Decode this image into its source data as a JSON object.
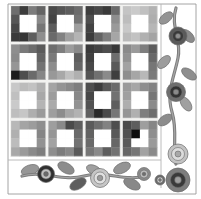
{
  "artwork": {
    "title": "Patchwork Quilt Panel with Floral Vine Border",
    "type": "textile-pattern",
    "palette": {
      "background": "#ffffff",
      "sashing": "#f2f2f0",
      "frame_line": "#9a9a9a",
      "vine_stem": "#7d7d7d",
      "leaf_light": "#a8a8a8",
      "leaf_mid": "#8c8c8c",
      "leaf_dark": "#5e5e5e",
      "flower_outer_dark": "#4a4a4a",
      "flower_outer_mid": "#8f8f8f",
      "flower_outer_light": "#cfcfcf",
      "flower_core_dark": "#2e2e2e",
      "flower_core_light": "#bdbdbd"
    },
    "canvas": {
      "width": 201,
      "height": 199
    }
  },
  "quilt": {
    "label": "quilt-grid",
    "block_rows": 4,
    "block_cols": 4,
    "cells_per_block": 4,
    "grid_origin": {
      "x": 11,
      "y": 6
    },
    "grid_size": {
      "width": 146,
      "height": 150
    },
    "sashing_width": 3,
    "blocks": [
      {
        "name": "block-r1c1",
        "cells": [
          [
            "#6e6e6e",
            "#3c3c3c",
            "#7c7c7c",
            "#646464"
          ],
          [
            "#565656",
            "#ffffff",
            "#ffffff",
            "#8a8a8a"
          ],
          [
            "#484848",
            "#ffffff",
            "#ffffff",
            "#767676"
          ],
          [
            "#3a3a3a",
            "#353535",
            "#5e5e5e",
            "#8e8e8e"
          ]
        ]
      },
      {
        "name": "block-r1c2",
        "cells": [
          [
            "#4a4a4a",
            "#555555",
            "#5e5e5e",
            "#6c6c6c"
          ],
          [
            "#444444",
            "#ffffff",
            "#ffffff",
            "#747474"
          ],
          [
            "#5c5c5c",
            "#ffffff",
            "#ffffff",
            "#9e9e9e"
          ],
          [
            "#6a6a6a",
            "#828282",
            "#a0a0a0",
            "#b4b4b4"
          ]
        ]
      },
      {
        "name": "block-r1c3",
        "cells": [
          [
            "#3e3e3e",
            "#484848",
            "#3a3a3a",
            "#6a6a6a"
          ],
          [
            "#4e4e4e",
            "#ffffff",
            "#ffffff",
            "#8e8e8e"
          ],
          [
            "#424242",
            "#ffffff",
            "#ffffff",
            "#9a9a9a"
          ],
          [
            "#3c3c3c",
            "#636363",
            "#7e7e7e",
            "#a6a6a6"
          ]
        ]
      },
      {
        "name": "block-r1c4",
        "cells": [
          [
            "#c4c4c4",
            "#cacaca",
            "#c0c0c0",
            "#b2b2b2"
          ],
          [
            "#bdbdbd",
            "#ffffff",
            "#ffffff",
            "#aeaeae"
          ],
          [
            "#c8c8c8",
            "#ffffff",
            "#ffffff",
            "#b6b6b6"
          ],
          [
            "#bababa",
            "#c2c2c2",
            "#b0b0b0",
            "#a4a4a4"
          ]
        ]
      },
      {
        "name": "block-r2c1",
        "cells": [
          [
            "#8e8e8e",
            "#7a7a7a",
            "#6c6c6c",
            "#5a5a5a"
          ],
          [
            "#8a8a8a",
            "#ffffff",
            "#ffffff",
            "#646464"
          ],
          [
            "#969696",
            "#ffffff",
            "#ffffff",
            "#727272"
          ],
          [
            "#1c1c1c",
            "#4e4e4e",
            "#6a6a6a",
            "#868686"
          ]
        ]
      },
      {
        "name": "block-r2c2",
        "cells": [
          [
            "#6e6e6e",
            "#7e7e7e",
            "#9c9c9c",
            "#8a8a8a"
          ],
          [
            "#7a7a7a",
            "#ffffff",
            "#ffffff",
            "#5e5e5e"
          ],
          [
            "#8c8c8c",
            "#ffffff",
            "#ffffff",
            "#666666"
          ],
          [
            "#989898",
            "#a8a8a8",
            "#c0c0c0",
            "#b0b0b0"
          ]
        ]
      },
      {
        "name": "block-r2c3",
        "cells": [
          [
            "#3a3a3a",
            "#444444",
            "#4e4e4e",
            "#383838"
          ],
          [
            "#404040",
            "#ffffff",
            "#ffffff",
            "#6e6e6e"
          ],
          [
            "#484848",
            "#ffffff",
            "#ffffff",
            "#5a5a5a"
          ],
          [
            "#555555",
            "#707070",
            "#8a8a8a",
            "#3e3e3e"
          ]
        ]
      },
      {
        "name": "block-r2c4",
        "cells": [
          [
            "#8a8a8a",
            "#9a9a9a",
            "#7e7e7e",
            "#5c5c5c"
          ],
          [
            "#929292",
            "#ffffff",
            "#ffffff",
            "#686868"
          ],
          [
            "#a2a2a2",
            "#ffffff",
            "#ffffff",
            "#767676"
          ],
          [
            "#8e8e8e",
            "#a6a6a6",
            "#b8b8b8",
            "#7a7a7a"
          ]
        ]
      },
      {
        "name": "block-r3c1",
        "cells": [
          [
            "#c8c8c8",
            "#bcbcbc",
            "#c2c2c2",
            "#b0b0b0"
          ],
          [
            "#c0c0c0",
            "#ffffff",
            "#ffffff",
            "#a8a8a8"
          ],
          [
            "#cacaca",
            "#ffffff",
            "#ffffff",
            "#b4b4b4"
          ],
          [
            "#bebebe",
            "#c6c6c6",
            "#aeaeae",
            "#9a9a9a"
          ]
        ]
      },
      {
        "name": "block-r3c2",
        "cells": [
          [
            "#a4a4a4",
            "#949494",
            "#8a8a8a",
            "#7e7e7e"
          ],
          [
            "#9c9c9c",
            "#ffffff",
            "#ffffff",
            "#888888"
          ],
          [
            "#aaaaaa",
            "#ffffff",
            "#ffffff",
            "#929292"
          ],
          [
            "#9e9e9e",
            "#8c8c8c",
            "#a6a6a6",
            "#b2b2b2"
          ]
        ]
      },
      {
        "name": "block-r3c3",
        "cells": [
          [
            "#4e4e4e",
            "#3c3c3c",
            "#585858",
            "#6a6a6a"
          ],
          [
            "#464646",
            "#ffffff",
            "#ffffff",
            "#727272"
          ],
          [
            "#525252",
            "#ffffff",
            "#ffffff",
            "#5e5e5e"
          ],
          [
            "#606060",
            "#2a2a2a",
            "#4a4a4a",
            "#767676"
          ]
        ]
      },
      {
        "name": "block-r3c4",
        "cells": [
          [
            "#9a9a9a",
            "#a6a6a6",
            "#8e8e8e",
            "#828282"
          ],
          [
            "#a0a0a0",
            "#ffffff",
            "#ffffff",
            "#767676"
          ],
          [
            "#aeaeae",
            "#ffffff",
            "#ffffff",
            "#8a8a8a"
          ],
          [
            "#969696",
            "#b0b0b0",
            "#7e7e7e",
            "#6e6e6e"
          ]
        ]
      },
      {
        "name": "block-r4c1",
        "cells": [
          [
            "#b8b8b8",
            "#a4a4a4",
            "#9c9c9c",
            "#8e8e8e"
          ],
          [
            "#b0b0b0",
            "#ffffff",
            "#ffffff",
            "#868686"
          ],
          [
            "#bcbcbc",
            "#ffffff",
            "#ffffff",
            "#929292"
          ],
          [
            "#a8a8a8",
            "#9a9a9a",
            "#8a8a8a",
            "#7e7e7e"
          ]
        ]
      },
      {
        "name": "block-r4c2",
        "cells": [
          [
            "#9e9e9e",
            "#8a8a8a",
            "#4a4a4a",
            "#5e5e5e"
          ],
          [
            "#969696",
            "#ffffff",
            "#ffffff",
            "#6a6a6a"
          ],
          [
            "#a2a2a2",
            "#ffffff",
            "#ffffff",
            "#727272"
          ],
          [
            "#8e8e8e",
            "#7c7c7c",
            "#888888",
            "#5a5a5a"
          ]
        ]
      },
      {
        "name": "block-r4c3",
        "cells": [
          [
            "#5a5a5a",
            "#6e6e6e",
            "#828282",
            "#4e4e4e"
          ],
          [
            "#626262",
            "#ffffff",
            "#ffffff",
            "#585858"
          ],
          [
            "#6a6a6a",
            "#ffffff",
            "#ffffff",
            "#666666"
          ],
          [
            "#767676",
            "#8a8a8a",
            "#5e5e5e",
            "#727272"
          ]
        ]
      },
      {
        "name": "block-r4c4",
        "cells": [
          [
            "#4a4a4a",
            "#5e5e5e",
            "#9e9e9e",
            "#868686"
          ],
          [
            "#525252",
            "#0e0e0e",
            "#ffffff",
            "#8e8e8e"
          ],
          [
            "#5a5a5a",
            "#ffffff",
            "#ffffff",
            "#9a9a9a"
          ],
          [
            "#666666",
            "#767676",
            "#a2a2a2",
            "#8a8a8a"
          ]
        ]
      }
    ]
  },
  "border_right": {
    "label": "right-vine-border",
    "stem_path": "M 176 8 C 170 26 182 40 178 58 C 174 78 166 92 172 112 C 178 132 172 148 176 164",
    "leaves": [
      {
        "name": "leaf-r1",
        "cx": 166,
        "cy": 18,
        "rx": 8,
        "ry": 4.5,
        "rot": -40,
        "fill": "#949494"
      },
      {
        "name": "leaf-r2",
        "cx": 188,
        "cy": 36,
        "rx": 8,
        "ry": 4.5,
        "rot": 45,
        "fill": "#8a8a8a"
      },
      {
        "name": "leaf-r3",
        "cx": 164,
        "cy": 62,
        "rx": 8,
        "ry": 4.5,
        "rot": -45,
        "fill": "#9c9c9c"
      },
      {
        "name": "leaf-r4",
        "cx": 189,
        "cy": 74,
        "rx": 8.5,
        "ry": 4.5,
        "rot": 35,
        "fill": "#8e8e8e"
      },
      {
        "name": "leaf-r5",
        "cx": 186,
        "cy": 104,
        "rx": 8,
        "ry": 4.5,
        "rot": 55,
        "fill": "#a0a0a0"
      },
      {
        "name": "leaf-r6",
        "cx": 165,
        "cy": 120,
        "rx": 8,
        "ry": 4.5,
        "rot": -35,
        "fill": "#8c8c8c"
      }
    ],
    "flowers": [
      {
        "name": "flower-r1",
        "cx": 178,
        "cy": 36,
        "r_outer": 9,
        "r_mid": 5.5,
        "r_core": 2.6,
        "outer": "#5a5a5a",
        "mid": "#3a3a3a",
        "core": "#8e8e8e"
      },
      {
        "name": "flower-r2",
        "cx": 176,
        "cy": 92,
        "r_outer": 9.5,
        "r_mid": 6,
        "r_core": 2.8,
        "outer": "#6e6e6e",
        "mid": "#333333",
        "core": "#8a8a8a"
      },
      {
        "name": "flower-r3",
        "cx": 178,
        "cy": 154,
        "r_outer": 10,
        "r_mid": 6.5,
        "r_core": 3,
        "outer": "#c2c2c2",
        "mid": "#dcdcdc",
        "core": "#a8a8a8"
      }
    ]
  },
  "border_bottom": {
    "label": "bottom-vine-border",
    "stem_path": "M 22 176 C 44 170 62 182 84 176 C 106 170 124 182 146 176",
    "leaves": [
      {
        "name": "leaf-b1",
        "cx": 30,
        "cy": 170,
        "rx": 9,
        "ry": 5,
        "rot": -18,
        "fill": "#979797"
      },
      {
        "name": "leaf-b2",
        "cx": 66,
        "cy": 168,
        "rx": 9,
        "ry": 5,
        "rot": 30,
        "fill": "#8c8c8c"
      },
      {
        "name": "leaf-b3",
        "cx": 78,
        "cy": 184,
        "rx": 9,
        "ry": 5,
        "rot": -30,
        "fill": "#5e5e5e"
      },
      {
        "name": "leaf-b4",
        "cx": 94,
        "cy": 170,
        "rx": 8,
        "ry": 4.5,
        "rot": 25,
        "fill": "#a0a0a0"
      },
      {
        "name": "leaf-b5",
        "cx": 122,
        "cy": 168,
        "rx": 9,
        "ry": 5,
        "rot": -25,
        "fill": "#949494"
      },
      {
        "name": "leaf-b6",
        "cx": 132,
        "cy": 184,
        "rx": 9,
        "ry": 5,
        "rot": 28,
        "fill": "#888888"
      }
    ],
    "flowers": [
      {
        "name": "flower-b1",
        "cx": 46,
        "cy": 174,
        "r_outer": 8.5,
        "r_mid": 5,
        "r_core": 2.4,
        "outer": "#2f2f2f",
        "mid": "#c0c0c0",
        "core": "#6a6a6a"
      },
      {
        "name": "flower-b2",
        "cx": 100,
        "cy": 178,
        "r_outer": 9.5,
        "r_mid": 6,
        "r_core": 2.8,
        "outer": "#c6c6c6",
        "mid": "#e0e0e0",
        "core": "#9a9a9a"
      },
      {
        "name": "flower-b3",
        "cx": 144,
        "cy": 174,
        "r_outer": 6.5,
        "r_mid": 4,
        "r_core": 1.8,
        "outer": "#8a8a8a",
        "mid": "#bdbdbd",
        "core": "#6e6e6e"
      },
      {
        "name": "flower-b4",
        "cx": 160,
        "cy": 180,
        "r_outer": 5,
        "r_mid": 3,
        "r_core": 1.4,
        "outer": "#6a6a6a",
        "mid": "#d0d0d0",
        "core": "#7a7a7a"
      }
    ]
  },
  "corner_motif": {
    "label": "corner-flower-cluster",
    "flowers": [
      {
        "name": "corner-flower-large",
        "cx": 178,
        "cy": 180,
        "r_outer": 12,
        "r_mid": 7.5,
        "r_core": 3.4,
        "outer": "#7e7e7e",
        "mid": "#3a3a3a",
        "core": "#9e9e9e"
      }
    ]
  },
  "frame": {
    "label": "panel-frame",
    "outer_line_color": "#9a9a9a",
    "inner_line_color": "#b4b4b4",
    "lines": [
      {
        "name": "frame-top",
        "x1": 8,
        "y1": 4,
        "x2": 196,
        "y2": 4
      },
      {
        "name": "frame-left",
        "x1": 8,
        "y1": 4,
        "x2": 8,
        "y2": 194
      },
      {
        "name": "frame-bottom",
        "x1": 8,
        "y1": 194,
        "x2": 196,
        "y2": 194
      },
      {
        "name": "frame-right",
        "x1": 196,
        "y1": 4,
        "x2": 196,
        "y2": 194
      },
      {
        "name": "divider-vertical",
        "x1": 161,
        "y1": 4,
        "x2": 161,
        "y2": 188
      },
      {
        "name": "divider-horizontal",
        "x1": 8,
        "y1": 160,
        "x2": 161,
        "y2": 160
      }
    ]
  }
}
